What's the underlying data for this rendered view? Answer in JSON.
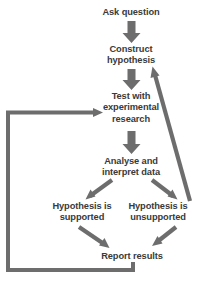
{
  "diagram": {
    "type": "flowchart",
    "colors": {
      "background": "#ffffff",
      "arrow": "#6b6b6b",
      "arrow_dark": "#707070",
      "text": "#3a3a3a"
    },
    "nodes": [
      {
        "id": "ask-question",
        "label": "Ask question",
        "cx": 131,
        "cy": 13
      },
      {
        "id": "construct-hypothesis",
        "label": "Construct\nhypothesis",
        "cx": 131,
        "cy": 55
      },
      {
        "id": "test-with-experimental-research",
        "label": "Test with\nexperimental\nresearch",
        "cx": 131,
        "cy": 108
      },
      {
        "id": "analyse-and-interpret-data",
        "label": "Analyse and\ninterpret data",
        "cx": 131,
        "cy": 167
      },
      {
        "id": "hypothesis-is-supported",
        "label": "Hypothesis is\nsupported",
        "cx": 82,
        "cy": 212
      },
      {
        "id": "hypothesis-is-unsupported",
        "label": "Hypothesis is\nunsupported",
        "cx": 158,
        "cy": 212
      },
      {
        "id": "report-results",
        "label": "Report results",
        "cx": 132,
        "cy": 257
      }
    ],
    "edges": [
      {
        "id": "ask-to-construct",
        "from": "ask-question",
        "to": "construct-hypothesis",
        "style": "block-arrow-down"
      },
      {
        "id": "construct-to-test",
        "from": "construct-hypothesis",
        "to": "test-with-experimental-research",
        "style": "block-arrow-down"
      },
      {
        "id": "test-to-analyse",
        "from": "test-with-experimental-research",
        "to": "analyse-and-interpret-data",
        "style": "block-arrow-down"
      },
      {
        "id": "analyse-to-supported",
        "from": "analyse-and-interpret-data",
        "to": "hypothesis-is-supported",
        "style": "diagonal-arrow"
      },
      {
        "id": "analyse-to-unsupported",
        "from": "analyse-and-interpret-data",
        "to": "hypothesis-is-unsupported",
        "style": "diagonal-arrow"
      },
      {
        "id": "supported-to-report",
        "from": "hypothesis-is-supported",
        "to": "report-results",
        "style": "diagonal-arrow"
      },
      {
        "id": "unsupported-to-report",
        "from": "hypothesis-is-unsupported",
        "to": "report-results",
        "style": "diagonal-arrow"
      },
      {
        "id": "unsupported-to-construct",
        "from": "hypothesis-is-unsupported",
        "to": "construct-hypothesis",
        "style": "long-diagonal-arrow-up"
      },
      {
        "id": "report-to-test",
        "from": "report-results",
        "to": "test-with-experimental-research",
        "style": "elbow-loop-left"
      }
    ]
  }
}
